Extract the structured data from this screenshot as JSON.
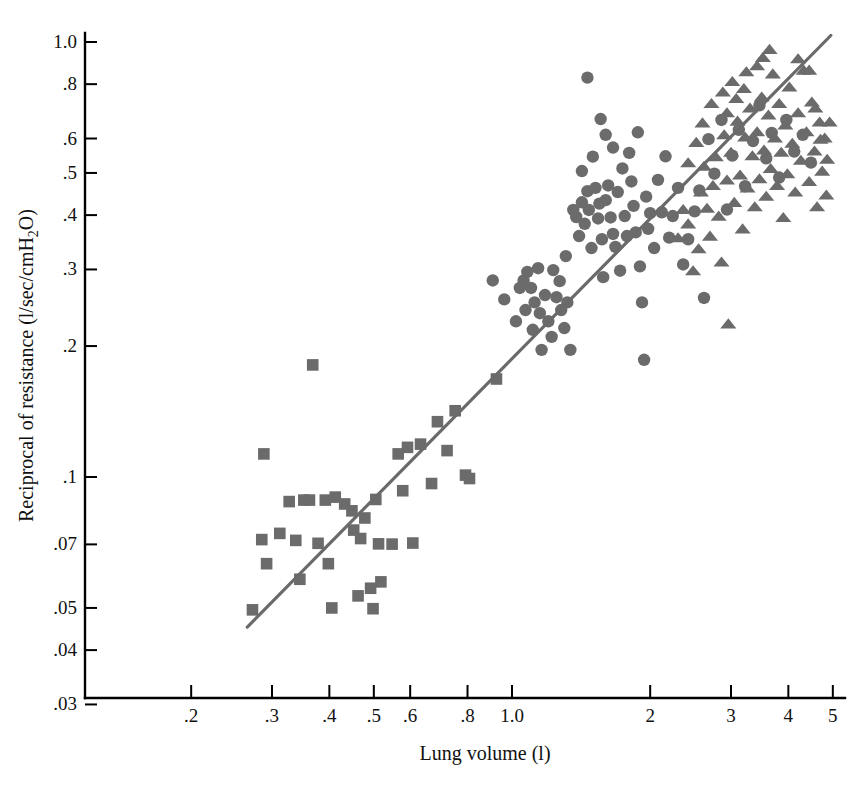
{
  "chart_data": {
    "type": "scatter",
    "title": "",
    "xlabel": "Lung volume (l)",
    "ylabel": "Reciprocal of resistance (l/sec/cmH₂O)",
    "xscale": "log",
    "yscale": "log",
    "xlim": [
      0.17,
      6.0
    ],
    "ylim": [
      0.03,
      1.08
    ],
    "grid": false,
    "legend": "none",
    "xticks": [
      {
        "value": 0.2,
        "label": ".2"
      },
      {
        "value": 0.3,
        "label": ".3"
      },
      {
        "value": 0.4,
        "label": ".4"
      },
      {
        "value": 0.5,
        "label": ".5"
      },
      {
        "value": 0.6,
        "label": ".6"
      },
      {
        "value": 0.8,
        "label": ".8"
      },
      {
        "value": 1.0,
        "label": "1.0"
      },
      {
        "value": 2.0,
        "label": "2"
      },
      {
        "value": 3.0,
        "label": "3"
      },
      {
        "value": 4.0,
        "label": "4"
      },
      {
        "value": 5.0,
        "label": "5"
      }
    ],
    "yticks": [
      {
        "value": 1.0,
        "label": "1.0"
      },
      {
        "value": 0.8,
        "label": ".8"
      },
      {
        "value": 0.6,
        "label": ".6"
      },
      {
        "value": 0.5,
        "label": ".5"
      },
      {
        "value": 0.4,
        "label": ".4"
      },
      {
        "value": 0.3,
        "label": ".3"
      },
      {
        "value": 0.2,
        "label": ".2"
      },
      {
        "value": 0.1,
        "label": ".1"
      },
      {
        "value": 0.07,
        "label": ".07"
      },
      {
        "value": 0.05,
        "label": ".05"
      },
      {
        "value": 0.04,
        "label": ".04"
      },
      {
        "value": 0.03,
        "label": ".03"
      }
    ],
    "marker_color": "#6b6b6b",
    "fit_line": {
      "color": "#6a6a6a",
      "x": [
        0.265,
        4.95
      ],
      "y": [
        0.0452,
        1.035
      ]
    },
    "series": [
      {
        "name": "infants",
        "marker": "square",
        "color": "#6b6b6b",
        "points": [
          [
            0.272,
            0.0495
          ],
          [
            0.285,
            0.0718
          ],
          [
            0.288,
            0.113
          ],
          [
            0.292,
            0.0632
          ],
          [
            0.312,
            0.0742
          ],
          [
            0.327,
            0.0878
          ],
          [
            0.338,
            0.0715
          ],
          [
            0.345,
            0.0582
          ],
          [
            0.352,
            0.0885
          ],
          [
            0.362,
            0.0885
          ],
          [
            0.368,
            0.181
          ],
          [
            0.378,
            0.0704
          ],
          [
            0.392,
            0.0885
          ],
          [
            0.398,
            0.0632
          ],
          [
            0.405,
            0.05
          ],
          [
            0.412,
            0.0899
          ],
          [
            0.432,
            0.0867
          ],
          [
            0.448,
            0.0836
          ],
          [
            0.452,
            0.0755
          ],
          [
            0.462,
            0.0533
          ],
          [
            0.468,
            0.0722
          ],
          [
            0.478,
            0.0805
          ],
          [
            0.492,
            0.0555
          ],
          [
            0.498,
            0.0498
          ],
          [
            0.505,
            0.0888
          ],
          [
            0.512,
            0.0702
          ],
          [
            0.518,
            0.0574
          ],
          [
            0.548,
            0.0701
          ],
          [
            0.565,
            0.113
          ],
          [
            0.578,
            0.093
          ],
          [
            0.592,
            0.117
          ],
          [
            0.608,
            0.0705
          ],
          [
            0.632,
            0.119
          ],
          [
            0.668,
            0.0966
          ],
          [
            0.688,
            0.134
          ],
          [
            0.722,
            0.115
          ],
          [
            0.752,
            0.142
          ],
          [
            0.792,
            0.101
          ],
          [
            0.808,
            0.0992
          ],
          [
            0.925,
            0.168
          ]
        ]
      },
      {
        "name": "children",
        "marker": "circle",
        "color": "#6b6b6b",
        "points": [
          [
            0.908,
            0.283
          ],
          [
            0.962,
            0.256
          ],
          [
            1.02,
            0.228
          ],
          [
            1.04,
            0.272
          ],
          [
            1.06,
            0.283
          ],
          [
            1.07,
            0.242
          ],
          [
            1.08,
            0.296
          ],
          [
            1.1,
            0.272
          ],
          [
            1.11,
            0.218
          ],
          [
            1.12,
            0.252
          ],
          [
            1.14,
            0.302
          ],
          [
            1.15,
            0.238
          ],
          [
            1.16,
            0.196
          ],
          [
            1.18,
            0.262
          ],
          [
            1.2,
            0.228
          ],
          [
            1.22,
            0.21
          ],
          [
            1.23,
            0.299
          ],
          [
            1.25,
            0.259
          ],
          [
            1.27,
            0.282
          ],
          [
            1.28,
            0.242
          ],
          [
            1.3,
            0.22
          ],
          [
            1.31,
            0.322
          ],
          [
            1.32,
            0.252
          ],
          [
            1.34,
            0.196
          ],
          [
            1.36,
            0.411
          ],
          [
            1.38,
            0.396
          ],
          [
            1.4,
            0.358
          ],
          [
            1.42,
            0.428
          ],
          [
            1.44,
            0.382
          ],
          [
            1.46,
            0.454
          ],
          [
            1.47,
            0.411
          ],
          [
            1.49,
            0.336
          ],
          [
            1.52,
            0.462
          ],
          [
            1.54,
            0.393
          ],
          [
            1.55,
            0.425
          ],
          [
            1.57,
            0.352
          ],
          [
            1.58,
            0.288
          ],
          [
            1.6,
            0.433
          ],
          [
            1.62,
            0.468
          ],
          [
            1.64,
            0.395
          ],
          [
            1.66,
            0.362
          ],
          [
            1.68,
            0.338
          ],
          [
            1.7,
            0.452
          ],
          [
            1.72,
            0.298
          ],
          [
            1.74,
            0.512
          ],
          [
            1.76,
            0.398
          ],
          [
            1.78,
            0.358
          ],
          [
            1.8,
            0.556
          ],
          [
            1.82,
            0.478
          ],
          [
            1.84,
            0.42
          ],
          [
            1.86,
            0.365
          ],
          [
            1.88,
            0.62
          ],
          [
            1.9,
            0.305
          ],
          [
            1.92,
            0.252
          ],
          [
            1.94,
            0.186
          ],
          [
            1.96,
            0.441
          ],
          [
            1.98,
            0.372
          ],
          [
            2.0,
            0.404
          ],
          [
            2.04,
            0.336
          ],
          [
            2.08,
            0.482
          ],
          [
            2.12,
            0.406
          ],
          [
            2.16,
            0.546
          ],
          [
            2.2,
            0.355
          ],
          [
            2.24,
            0.398
          ],
          [
            2.3,
            0.462
          ],
          [
            2.36,
            0.308
          ],
          [
            2.42,
            0.352
          ],
          [
            2.5,
            0.408
          ],
          [
            2.56,
            0.456
          ],
          [
            2.62,
            0.258
          ],
          [
            2.68,
            0.598
          ],
          [
            2.76,
            0.498
          ],
          [
            2.86,
            0.662
          ],
          [
            2.94,
            0.412
          ],
          [
            3.02,
            0.548
          ],
          [
            3.12,
            0.628
          ],
          [
            3.22,
            0.466
          ],
          [
            3.35,
            0.592
          ],
          [
            3.46,
            0.715
          ],
          [
            3.58,
            0.54
          ],
          [
            3.68,
            0.618
          ],
          [
            3.82,
            0.488
          ],
          [
            3.96,
            0.662
          ],
          [
            4.12,
            0.56
          ],
          [
            4.3,
            0.612
          ],
          [
            4.48,
            0.528
          ],
          [
            1.46,
            0.828
          ],
          [
            1.56,
            0.665
          ],
          [
            1.6,
            0.612
          ],
          [
            1.66,
            0.572
          ],
          [
            1.5,
            0.545
          ],
          [
            1.42,
            0.505
          ]
        ]
      },
      {
        "name": "adults",
        "marker": "triangle",
        "color": "#6b6b6b",
        "points": [
          [
            2.42,
            0.382
          ],
          [
            2.48,
            0.298
          ],
          [
            2.55,
            0.335
          ],
          [
            2.58,
            0.452
          ],
          [
            2.62,
            0.518
          ],
          [
            2.66,
            0.415
          ],
          [
            2.7,
            0.358
          ],
          [
            2.74,
            0.468
          ],
          [
            2.78,
            0.545
          ],
          [
            2.82,
            0.398
          ],
          [
            2.86,
            0.312
          ],
          [
            2.9,
            0.612
          ],
          [
            2.94,
            0.482
          ],
          [
            2.96,
            0.225
          ],
          [
            3.0,
            0.558
          ],
          [
            3.05,
            0.428
          ],
          [
            3.1,
            0.658
          ],
          [
            3.14,
            0.495
          ],
          [
            3.18,
            0.372
          ],
          [
            3.22,
            0.605
          ],
          [
            3.26,
            0.462
          ],
          [
            3.3,
            0.705
          ],
          [
            3.34,
            0.548
          ],
          [
            3.38,
            0.418
          ],
          [
            3.42,
            0.622
          ],
          [
            3.46,
            0.485
          ],
          [
            3.5,
            0.748
          ],
          [
            3.54,
            0.565
          ],
          [
            3.58,
            0.442
          ],
          [
            3.62,
            0.68
          ],
          [
            3.66,
            0.512
          ],
          [
            3.7,
            0.845
          ],
          [
            3.74,
            0.602
          ],
          [
            3.78,
            0.468
          ],
          [
            3.82,
            0.722
          ],
          [
            3.86,
            0.558
          ],
          [
            3.9,
            0.395
          ],
          [
            3.94,
            0.645
          ],
          [
            3.98,
            0.498
          ],
          [
            4.02,
            0.788
          ],
          [
            4.08,
            0.585
          ],
          [
            4.14,
            0.452
          ],
          [
            4.2,
            0.688
          ],
          [
            4.26,
            0.535
          ],
          [
            4.32,
            0.862
          ],
          [
            4.38,
            0.622
          ],
          [
            4.44,
            0.478
          ],
          [
            4.5,
            0.728
          ],
          [
            4.56,
            0.562
          ],
          [
            4.62,
            0.418
          ],
          [
            4.68,
            0.655
          ],
          [
            4.74,
            0.505
          ],
          [
            4.8,
            0.602
          ],
          [
            4.86,
            0.538
          ],
          [
            4.92,
            0.655
          ],
          [
            2.3,
            0.355
          ],
          [
            2.36,
            0.412
          ],
          [
            2.42,
            0.528
          ],
          [
            2.52,
            0.588
          ],
          [
            2.6,
            0.652
          ],
          [
            2.72,
            0.722
          ],
          [
            2.88,
            0.768
          ],
          [
            3.02,
            0.812
          ],
          [
            3.24,
            0.855
          ],
          [
            3.42,
            0.882
          ],
          [
            2.94,
            0.688
          ],
          [
            3.08,
            0.742
          ],
          [
            3.2,
            0.782
          ],
          [
            3.52,
            0.922
          ],
          [
            3.64,
            0.962
          ],
          [
            4.2,
            0.915
          ],
          [
            4.44,
            0.862
          ],
          [
            4.58,
            0.705
          ],
          [
            4.7,
            0.598
          ],
          [
            4.84,
            0.445
          ]
        ]
      }
    ]
  }
}
